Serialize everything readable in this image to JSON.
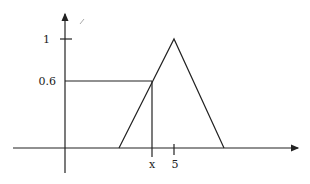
{
  "diagram": {
    "type": "triangular-membership-function",
    "y_axis": {
      "ticks": [
        {
          "label": "1",
          "value": 1
        },
        {
          "label": "0.6",
          "value": 0.6
        }
      ]
    },
    "x_axis": {
      "ticks": [
        {
          "label": "x"
        },
        {
          "label": "5",
          "value": 5
        }
      ]
    },
    "triangle": {
      "peak_label": "5",
      "peak_value": 1
    },
    "marker": {
      "x_label": "x",
      "y_label": "0.6"
    },
    "colors": {
      "line": "#222222",
      "background": "#ffffff"
    }
  }
}
